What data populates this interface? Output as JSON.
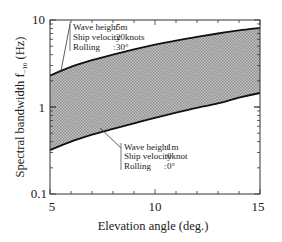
{
  "chart_data": {
    "type": "area",
    "title": "",
    "xlabel": "Elevation angle (deg.)",
    "ylabel": "Spectral bandwidth f₋₁₀ (Hz)",
    "ylabel_main": "Spectral bandwidth f",
    "ylabel_sub": "−10",
    "ylabel_unit": "(Hz)",
    "xlim": [
      5,
      15
    ],
    "ylim": [
      0.1,
      10
    ],
    "yscale": "log",
    "x_ticks": [
      "5",
      "10",
      "15"
    ],
    "y_ticks": [
      "0.1",
      "1",
      "10"
    ],
    "grid": false,
    "fill": "hatched gray band between upper and lower curves",
    "series": [
      {
        "name": "Upper bound",
        "x": [
          5,
          6,
          7,
          8,
          9,
          10,
          11,
          12,
          13,
          14,
          15
        ],
        "values": [
          2.3,
          2.9,
          3.45,
          4.0,
          4.6,
          5.2,
          5.8,
          6.4,
          7.0,
          7.6,
          8.1
        ]
      },
      {
        "name": "Lower bound",
        "x": [
          5,
          6,
          7,
          8,
          9,
          10,
          11,
          12,
          13,
          14,
          15
        ],
        "values": [
          0.32,
          0.4,
          0.48,
          0.56,
          0.65,
          0.75,
          0.86,
          0.98,
          1.1,
          1.28,
          1.45
        ]
      }
    ],
    "annotations": [
      {
        "target": "Upper bound",
        "lines": [
          {
            "label": "Wave height",
            "value": "5m"
          },
          {
            "label": "Ship velocity",
            "value": "20knots"
          },
          {
            "label": "Rolling",
            "value": "30°"
          }
        ]
      },
      {
        "target": "Lower bound",
        "lines": [
          {
            "label": "Wave height",
            "value": "1m"
          },
          {
            "label": "Ship velocity",
            "value": "0knot"
          },
          {
            "label": "Rolling",
            "value": "0°"
          }
        ]
      }
    ]
  },
  "style": {
    "axis_color": "#333333",
    "curve_color": "#111111",
    "fill_color": "#b8b8b8",
    "hatch_color": "#8a8a8a"
  }
}
